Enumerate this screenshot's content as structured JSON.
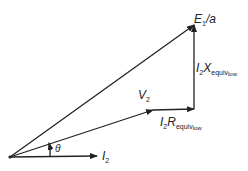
{
  "diagram": {
    "type": "phasor-diagram",
    "colors": {
      "line": "#222222",
      "background": "#ffffff"
    },
    "labels": {
      "e1a": {
        "main": "E",
        "sub": "1",
        "tail": "/a"
      },
      "ix": {
        "i": "I",
        "isub": "2",
        "var": "X",
        "sub": "equiv",
        "subsub": "low"
      },
      "v2": {
        "main": "V",
        "sub": "2"
      },
      "ir": {
        "i": "I",
        "isub": "2",
        "var": "R",
        "sub": "equiv",
        "subsub": "low"
      },
      "theta": "θ",
      "i2": {
        "main": "I",
        "sub": "2"
      }
    },
    "vectors": [
      {
        "name": "I2",
        "from": [
          10,
          157
        ],
        "to": [
          97,
          156
        ]
      },
      {
        "name": "V2",
        "from": [
          10,
          157
        ],
        "to": [
          153,
          110
        ]
      },
      {
        "name": "I2Requiv",
        "from": [
          153,
          110
        ],
        "to": [
          194,
          109
        ]
      },
      {
        "name": "I2Xequiv",
        "from": [
          194,
          109
        ],
        "to": [
          194,
          25
        ]
      },
      {
        "name": "E1/a",
        "from": [
          10,
          157
        ],
        "to": [
          194,
          25
        ]
      }
    ]
  }
}
